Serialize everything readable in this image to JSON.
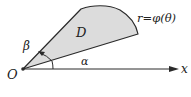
{
  "diagram": {
    "title": "",
    "type": "polar-region",
    "colors": {
      "region_fill": "#dcdcdc",
      "stroke": "#2a2a2a",
      "background": "#ffffff"
    },
    "labels": {
      "origin": "O",
      "x_axis": "x",
      "region": "D",
      "curve": "r=φ(θ)",
      "angle_lower": "α",
      "angle_upper": "β"
    },
    "nodes": [
      {
        "id": "origin",
        "label": "O"
      },
      {
        "id": "region",
        "label": "D"
      }
    ],
    "edges": [
      {
        "from": "origin",
        "to": "x-axis",
        "label": "x"
      },
      {
        "from": "origin",
        "to": "ray-alpha",
        "label": "α"
      },
      {
        "from": "origin",
        "to": "ray-beta",
        "label": "β"
      }
    ]
  }
}
